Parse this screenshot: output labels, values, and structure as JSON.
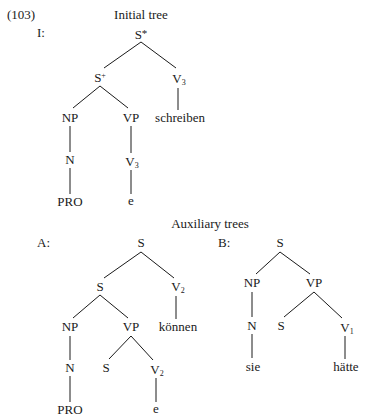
{
  "example_number": "(103)",
  "initial_tree": {
    "title": "Initial tree",
    "label": "I:",
    "nodes": {
      "root": {
        "cat": "S",
        "sup": "*"
      },
      "s": {
        "cat": "S",
        "sup": "+"
      },
      "v3": {
        "cat": "V",
        "sub": "3"
      },
      "schreiben": "schreiben",
      "np": "NP",
      "vp": "VP",
      "n": "N",
      "v3_lower": {
        "cat": "V",
        "sub": "3"
      },
      "pro": "PRO",
      "e": "e"
    }
  },
  "auxiliary_trees": {
    "title": "Auxiliary trees",
    "A": {
      "label": "A:",
      "nodes": {
        "root": "S",
        "s": "S",
        "v2": {
          "cat": "V",
          "sub": "2"
        },
        "koennen": "können",
        "np": "NP",
        "vp": "VP",
        "n": "N",
        "s_foot": "S",
        "v2_lower": {
          "cat": "V",
          "sub": "2"
        },
        "pro": "PRO",
        "e": "e"
      }
    },
    "B": {
      "label": "B:",
      "nodes": {
        "root": "S",
        "np": "NP",
        "vp": "VP",
        "n": "N",
        "s_foot": "S",
        "v1": {
          "cat": "V",
          "sub": "1"
        },
        "sie": "sie",
        "haette": "hätte"
      }
    }
  }
}
